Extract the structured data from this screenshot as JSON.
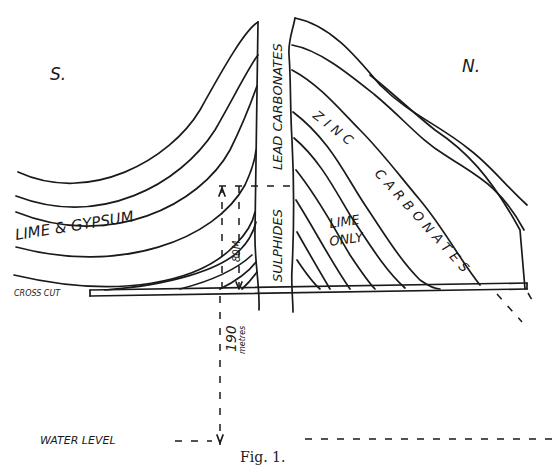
{
  "figure": {
    "caption": "Fig. 1.",
    "compass": {
      "south": "S.",
      "north": "N."
    },
    "labels": {
      "vein_upper": "LEAD CARBONATES",
      "vein_lower": "SULPHIDES",
      "left_strata": "LIME & GYPSUM",
      "right_zinc_word1": "ZINC",
      "right_zinc_word2": "CARBONATES",
      "right_lime_line1": "LIME",
      "right_lime_line2": "ONLY",
      "cross_cut": "CROSS CUT",
      "height_dim": "80M",
      "depth_value": "190",
      "depth_unit": "metres",
      "water_level": "WATER LEVEL"
    },
    "colors": {
      "ink": "#1a1a1a",
      "paper": "#ffffff"
    }
  }
}
